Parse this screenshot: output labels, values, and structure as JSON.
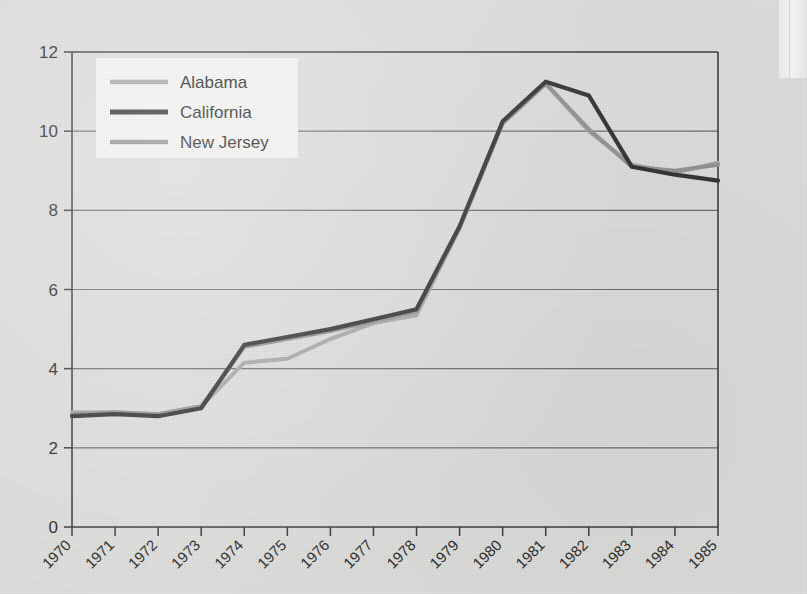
{
  "chart_data": {
    "type": "line",
    "title": "",
    "xlabel": "",
    "ylabel": "",
    "x": [
      1970,
      1971,
      1972,
      1973,
      1974,
      1975,
      1976,
      1977,
      1978,
      1979,
      1980,
      1981,
      1982,
      1983,
      1984,
      1985
    ],
    "categories": [
      "1970",
      "1971",
      "1972",
      "1973",
      "1974",
      "1975",
      "1976",
      "1977",
      "1978",
      "1979",
      "1980",
      "1981",
      "1982",
      "1983",
      "1984",
      "1985"
    ],
    "series": [
      {
        "name": "Alabama",
        "color": "#a8a8a8",
        "values": [
          2.9,
          2.9,
          2.85,
          3.05,
          4.15,
          4.25,
          4.75,
          5.15,
          5.35,
          7.55,
          10.2,
          11.2,
          10.0,
          9.15,
          8.95,
          9.2
        ]
      },
      {
        "name": "California",
        "color": "#333333",
        "values": [
          2.8,
          2.85,
          2.8,
          3.0,
          4.6,
          4.8,
          5.0,
          5.25,
          5.5,
          7.6,
          10.25,
          11.25,
          10.9,
          9.1,
          8.9,
          8.75
        ]
      },
      {
        "name": "New Jersey",
        "color": "#939393",
        "values": [
          2.85,
          2.9,
          2.85,
          3.05,
          4.55,
          4.75,
          4.95,
          5.2,
          5.45,
          7.55,
          10.2,
          11.2,
          10.05,
          9.1,
          9.0,
          9.15
        ]
      }
    ],
    "ylim": [
      0,
      12
    ],
    "yticks": [
      0,
      2,
      4,
      6,
      8,
      10,
      12
    ],
    "ytick_labels": [
      "0",
      "2",
      "4",
      "6",
      "8",
      "10",
      "12"
    ],
    "grid": true,
    "grid_axis": "y",
    "legend_position": "upper-left",
    "xtick_rotation": -45
  },
  "legend": {
    "entries": [
      {
        "label": "Alabama"
      },
      {
        "label": "California"
      },
      {
        "label": "New Jersey"
      }
    ]
  },
  "icons": {
    "legend_swatch": "line-swatch-icon"
  }
}
